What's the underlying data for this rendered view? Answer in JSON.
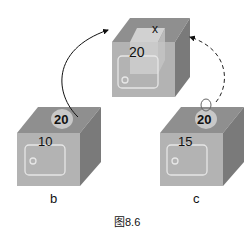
{
  "diagram": {
    "caption": "图8.6",
    "boxes": {
      "top": {
        "front_value": "20",
        "inner_label": "x"
      },
      "left": {
        "front_value": "10",
        "tag_value": "20",
        "label": "b"
      },
      "right": {
        "front_value": "15",
        "tag_value": "20",
        "label": "c"
      }
    },
    "arrows": [
      {
        "from": "left",
        "to": "top",
        "style": "solid"
      },
      {
        "from": "right",
        "to": "top",
        "style": "dashed"
      }
    ],
    "colors": {
      "front": "#b3b3b3",
      "top": "#8f8f8f",
      "side": "#7a7a7a",
      "tag": "#c8c8c8",
      "inner_box": "#d6d6d6",
      "window_outline": "#e6e6e6"
    }
  }
}
